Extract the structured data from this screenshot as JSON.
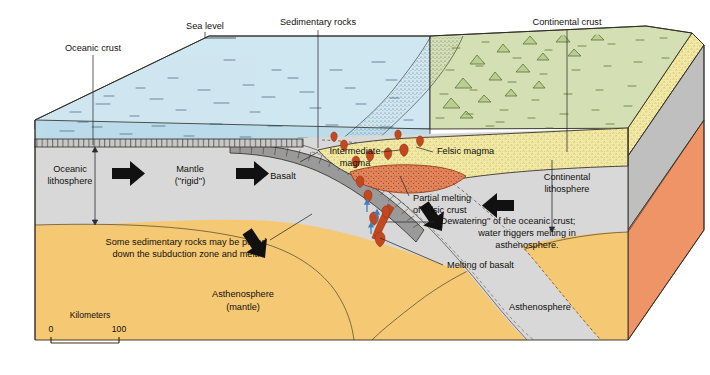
{
  "figure": {
    "kind": "geologic-block-diagram"
  },
  "palette": {
    "ocean_water": "#bcdcea",
    "ocean_water_top": "#cfe7f1",
    "continental_surface": "#d4dfb4",
    "sediment_yellow": "#f2e9a4",
    "lithosphere_gray": "#d8d8d8",
    "lithosphere_gray_side": "#bfbfbf",
    "asthenosphere_orange": "#f5c873",
    "asthenosphere_side": "#ef9466",
    "magma_red": "#c4481f",
    "partial_melt": "#e0855c",
    "outline": "#2f2b22",
    "water_arrow_blue": "#3d7fc1",
    "arrow_black": "#111111"
  },
  "labels": {
    "sea_level": "Sea level",
    "sedimentary_rocks": "Sedimentary rocks",
    "continental_crust": "Continental crust",
    "oceanic_crust": "Oceanic crust",
    "oceanic_lithosphere_1": "Oceanic",
    "oceanic_lithosphere_2": "lithosphere",
    "mantle_1": "Mantle",
    "mantle_2": "(''rigid'')",
    "basalt": "Basalt",
    "intermediate_magma_1": "Intermediate",
    "intermediate_magma_2": "magma",
    "felsic_magma": "Felsic magma",
    "continental_lithosphere_1": "Continental",
    "continental_lithosphere_2": "lithosphere",
    "partial_melting_1": "Partial melting",
    "partial_melting_2": "of felsic crust",
    "dewatering_1": "''Dewatering'' of the oceanic crust;",
    "dewatering_2": "water triggers melting in",
    "dewatering_3": "asthenosphere.",
    "melting_of_basalt": "Melting of basalt",
    "sediment_note_1": "Some sedimentary rocks may be pulled",
    "sediment_note_2": "down the subduction zone and melt.",
    "asthenosphere_left_1": "Asthenosphere",
    "asthenosphere_left_2": "(mantle)",
    "asthenosphere_right": "Asthenosphere"
  },
  "scale_bar": {
    "caption": "Kilometers",
    "min_label": "0",
    "max_label": "100"
  }
}
